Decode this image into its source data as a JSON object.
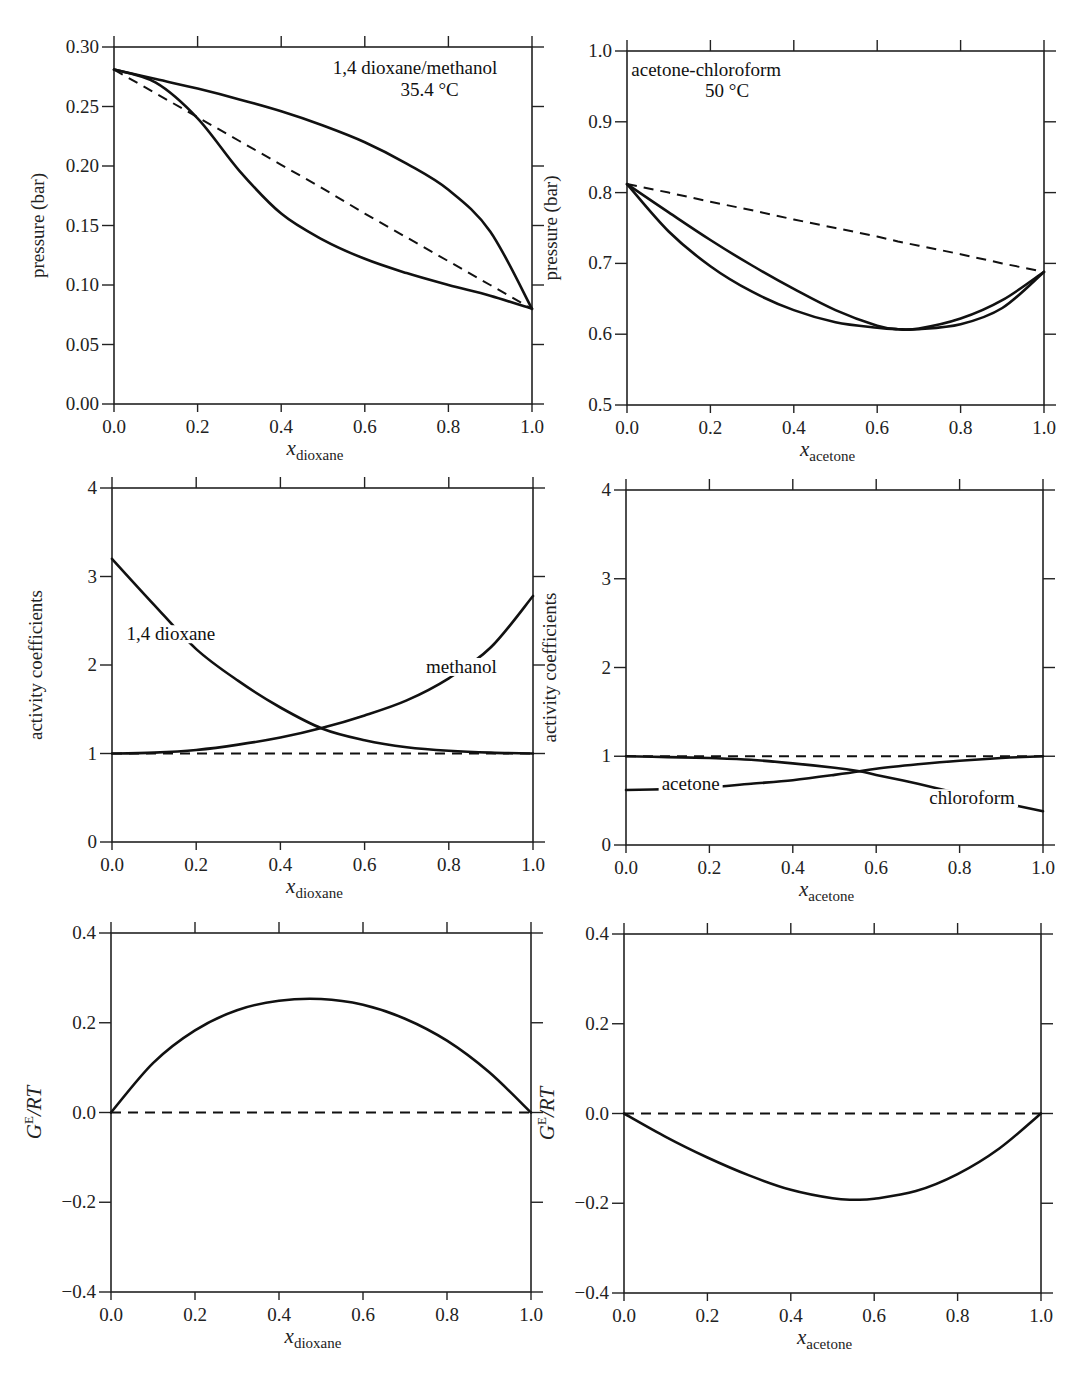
{
  "figure": {
    "panels": [
      {
        "id": "p1",
        "box": {
          "x0": 114,
          "y0": 47,
          "x1": 532,
          "y1": 404
        },
        "ylim": [
          0.0,
          0.3
        ],
        "yticks": [
          0.0,
          0.05,
          0.1,
          0.15,
          0.2,
          0.25,
          0.3
        ],
        "ytick_labels": [
          "0.00",
          "0.05",
          "0.10",
          "0.15",
          "0.20",
          "0.25",
          "0.30"
        ],
        "ylabel": "pressure (bar)",
        "xlabel_main": "x",
        "xlabel_sub": "dioxane",
        "annotations": [
          {
            "text": "1,4 dioxane/methanol",
            "x": 0.72,
            "y": 0.277
          },
          {
            "text": "35.4 °C",
            "x": 0.755,
            "y": 0.259
          }
        ]
      },
      {
        "id": "p2",
        "box": {
          "x0": 627,
          "y0": 51,
          "x1": 1044,
          "y1": 405
        },
        "ylim": [
          0.5,
          1.0
        ],
        "yticks": [
          0.5,
          0.6,
          0.7,
          0.8,
          0.9,
          1.0
        ],
        "ytick_labels": [
          "0.5",
          "0.6",
          "0.7",
          "0.8",
          "0.9",
          "1.0"
        ],
        "ylabel": "pressure (bar)",
        "xlabel_main": "x",
        "xlabel_sub": "acetone",
        "annotations": [
          {
            "text": "acetone-chloroform",
            "x": 0.19,
            "y": 0.965
          },
          {
            "text": "50 °C",
            "x": 0.24,
            "y": 0.935
          }
        ]
      },
      {
        "id": "p3",
        "box": {
          "x0": 112,
          "y0": 488,
          "x1": 533,
          "y1": 842
        },
        "ylim": [
          0,
          4
        ],
        "yticks": [
          0,
          1,
          2,
          3,
          4
        ],
        "ytick_labels": [
          "0",
          "1",
          "2",
          "3",
          "4"
        ],
        "ylabel": "activity coefficients",
        "xlabel_main": "x",
        "xlabel_sub": "dioxane",
        "annotations": [
          {
            "text": "1,4 dioxane",
            "x": 0.14,
            "y": 2.28
          },
          {
            "text": "methanol",
            "x": 0.83,
            "y": 1.91
          }
        ]
      },
      {
        "id": "p4",
        "box": {
          "x0": 626,
          "y0": 490,
          "x1": 1043,
          "y1": 845
        },
        "ylim": [
          0,
          4
        ],
        "yticks": [
          0,
          1,
          2,
          3,
          4
        ],
        "ytick_labels": [
          "0",
          "1",
          "2",
          "3",
          "4"
        ],
        "ylabel": "activity coefficients",
        "xlabel_main": "x",
        "xlabel_sub": "acetone",
        "annotations": [
          {
            "text": "acetone",
            "x": 0.155,
            "y": 0.62
          },
          {
            "text": "chloroform",
            "x": 0.83,
            "y": 0.46
          }
        ]
      },
      {
        "id": "p5",
        "box": {
          "x0": 111,
          "y0": 933,
          "x1": 531,
          "y1": 1292
        },
        "ylim": [
          -0.4,
          0.4
        ],
        "yticks": [
          -0.4,
          -0.2,
          0.0,
          0.2,
          0.4
        ],
        "ytick_labels": [
          "−0.4",
          "−0.2",
          "0.0",
          "0.2",
          "0.4"
        ],
        "ylabel_main": "G",
        "ylabel_sup": "E",
        "ylabel_rest": "/RT",
        "xlabel_main": "x",
        "xlabel_sub": "dioxane",
        "annotations": []
      },
      {
        "id": "p6",
        "box": {
          "x0": 624,
          "y0": 934,
          "x1": 1041,
          "y1": 1293
        },
        "ylim": [
          -0.4,
          0.4
        ],
        "yticks": [
          -0.4,
          -0.2,
          0.0,
          0.2,
          0.4
        ],
        "ytick_labels": [
          "−0.4",
          "−0.2",
          "0.0",
          "0.2",
          "0.4"
        ],
        "ylabel_main": "G",
        "ylabel_sup": "E",
        "ylabel_rest": "/RT",
        "xlabel_main": "x",
        "xlabel_sub": "acetone",
        "annotations": []
      }
    ],
    "xticks": [
      0.0,
      0.2,
      0.4,
      0.6,
      0.8,
      1.0
    ],
    "xtick_labels": [
      "0.0",
      "0.2",
      "0.4",
      "0.6",
      "0.8",
      "1.0"
    ]
  },
  "chart_data": [
    {
      "type": "line",
      "title": "1,4 dioxane/methanol 35.4 °C",
      "xlabel": "x_dioxane",
      "ylabel": "pressure (bar)",
      "xlim": [
        0,
        1
      ],
      "ylim": [
        0.0,
        0.3
      ],
      "grid": false,
      "x": [
        0.0,
        0.1,
        0.2,
        0.3,
        0.4,
        0.5,
        0.6,
        0.7,
        0.8,
        0.9,
        1.0
      ],
      "series": [
        {
          "name": "bubble line (liquid)",
          "style": "solid",
          "values": [
            0.281,
            0.273,
            0.265,
            0.256,
            0.246,
            0.234,
            0.22,
            0.202,
            0.18,
            0.145,
            0.08
          ]
        },
        {
          "name": "dew line (vapor)",
          "style": "solid",
          "values": [
            0.281,
            0.27,
            0.24,
            0.196,
            0.16,
            0.138,
            0.122,
            0.11,
            0.1,
            0.091,
            0.08
          ]
        },
        {
          "name": "Raoult's law (ideal)",
          "style": "dashed",
          "values": [
            0.281,
            0.261,
            0.241,
            0.221,
            0.201,
            0.181,
            0.16,
            0.14,
            0.12,
            0.1,
            0.08
          ]
        }
      ]
    },
    {
      "type": "line",
      "title": "acetone-chloroform 50 °C",
      "xlabel": "x_acetone",
      "ylabel": "pressure (bar)",
      "xlim": [
        0,
        1
      ],
      "ylim": [
        0.5,
        1.0
      ],
      "grid": false,
      "x": [
        0.0,
        0.1,
        0.2,
        0.3,
        0.4,
        0.5,
        0.6,
        0.65,
        0.7,
        0.8,
        0.9,
        1.0
      ],
      "series": [
        {
          "name": "bubble line (liquid)",
          "style": "solid",
          "values": [
            0.812,
            0.772,
            0.733,
            0.697,
            0.664,
            0.634,
            0.612,
            0.607,
            0.608,
            0.622,
            0.648,
            0.688
          ]
        },
        {
          "name": "dew line (vapor)",
          "style": "solid",
          "values": [
            0.812,
            0.745,
            0.696,
            0.66,
            0.634,
            0.617,
            0.609,
            0.607,
            0.607,
            0.614,
            0.637,
            0.688
          ]
        },
        {
          "name": "Raoult's law (ideal)",
          "style": "dashed",
          "values": [
            0.812,
            0.8,
            0.787,
            0.775,
            0.762,
            0.75,
            0.738,
            0.731,
            0.725,
            0.713,
            0.7,
            0.688
          ]
        }
      ]
    },
    {
      "type": "line",
      "title": "",
      "xlabel": "x_dioxane",
      "ylabel": "activity coefficients",
      "xlim": [
        0,
        1
      ],
      "ylim": [
        0,
        4
      ],
      "grid": false,
      "x": [
        0.0,
        0.1,
        0.2,
        0.3,
        0.4,
        0.5,
        0.6,
        0.7,
        0.8,
        0.9,
        1.0
      ],
      "series": [
        {
          "name": "1,4 dioxane",
          "style": "solid",
          "values": [
            3.2,
            2.68,
            2.18,
            1.82,
            1.52,
            1.28,
            1.15,
            1.07,
            1.03,
            1.01,
            1.0
          ]
        },
        {
          "name": "methanol",
          "style": "solid",
          "values": [
            1.0,
            1.01,
            1.04,
            1.1,
            1.18,
            1.29,
            1.43,
            1.6,
            1.85,
            2.2,
            2.78
          ]
        },
        {
          "name": "ideal (γ = 1)",
          "style": "dashed",
          "values": [
            1,
            1,
            1,
            1,
            1,
            1,
            1,
            1,
            1,
            1,
            1
          ]
        }
      ]
    },
    {
      "type": "line",
      "title": "",
      "xlabel": "x_acetone",
      "ylabel": "activity coefficients",
      "xlim": [
        0,
        1
      ],
      "ylim": [
        0,
        4
      ],
      "grid": false,
      "x": [
        0.0,
        0.1,
        0.2,
        0.3,
        0.4,
        0.5,
        0.56,
        0.6,
        0.7,
        0.8,
        0.9,
        1.0
      ],
      "series": [
        {
          "name": "acetone",
          "style": "solid",
          "values": [
            0.62,
            0.63,
            0.65,
            0.69,
            0.73,
            0.79,
            0.83,
            0.86,
            0.91,
            0.95,
            0.98,
            1.0
          ]
        },
        {
          "name": "chloroform",
          "style": "solid",
          "values": [
            1.0,
            0.99,
            0.98,
            0.96,
            0.92,
            0.87,
            0.83,
            0.79,
            0.69,
            0.58,
            0.48,
            0.38
          ]
        },
        {
          "name": "ideal (γ = 1)",
          "style": "dashed",
          "values": [
            1,
            1,
            1,
            1,
            1,
            1,
            1,
            1,
            1,
            1,
            1,
            1
          ]
        }
      ]
    },
    {
      "type": "line",
      "title": "",
      "xlabel": "x_dioxane",
      "ylabel": "G^E/RT",
      "xlim": [
        0,
        1
      ],
      "ylim": [
        -0.4,
        0.4
      ],
      "grid": false,
      "x": [
        0.0,
        0.1,
        0.2,
        0.3,
        0.4,
        0.5,
        0.6,
        0.7,
        0.8,
        0.9,
        1.0
      ],
      "series": [
        {
          "name": "G^E/RT",
          "style": "solid",
          "values": [
            0.0,
            0.11,
            0.183,
            0.228,
            0.249,
            0.253,
            0.24,
            0.209,
            0.16,
            0.09,
            0.0
          ]
        },
        {
          "name": "ideal (zero)",
          "style": "dashed",
          "values": [
            0,
            0,
            0,
            0,
            0,
            0,
            0,
            0,
            0,
            0,
            0
          ]
        }
      ]
    },
    {
      "type": "line",
      "title": "",
      "xlabel": "x_acetone",
      "ylabel": "G^E/RT",
      "xlim": [
        0,
        1
      ],
      "ylim": [
        -0.4,
        0.4
      ],
      "grid": false,
      "x": [
        0.0,
        0.1,
        0.2,
        0.3,
        0.4,
        0.5,
        0.55,
        0.6,
        0.7,
        0.8,
        0.9,
        1.0
      ],
      "series": [
        {
          "name": "G^E/RT",
          "style": "solid",
          "values": [
            0.0,
            -0.052,
            -0.098,
            -0.138,
            -0.17,
            -0.189,
            -0.192,
            -0.19,
            -0.173,
            -0.135,
            -0.078,
            0.0
          ]
        },
        {
          "name": "ideal (zero)",
          "style": "dashed",
          "values": [
            0,
            0,
            0,
            0,
            0,
            0,
            0,
            0,
            0,
            0,
            0,
            0
          ]
        }
      ]
    }
  ]
}
